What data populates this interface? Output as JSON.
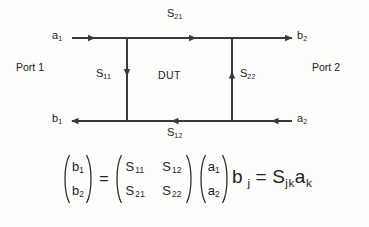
{
  "diagram": {
    "dut_label": "DUT",
    "ports": [
      {
        "name": "port-1",
        "label": "Port 1"
      },
      {
        "name": "port-2",
        "label": "Port 2"
      }
    ],
    "waves": {
      "a1": {
        "base": "a",
        "index": "1"
      },
      "b2": {
        "base": "b",
        "index": "2"
      },
      "b1": {
        "base": "b",
        "index": "1"
      },
      "a2": {
        "base": "a",
        "index": "2"
      }
    },
    "s_parameters": {
      "s21": {
        "base": "S",
        "index": "21",
        "position": "top",
        "direction": "left-to-right"
      },
      "s12": {
        "base": "S",
        "index": "12",
        "position": "bottom",
        "direction": "right-to-left"
      },
      "s11": {
        "base": "S",
        "index": "11",
        "position": "left-vertical",
        "direction": "down"
      },
      "s22": {
        "base": "S",
        "index": "22",
        "position": "right-vertical",
        "direction": "up"
      }
    },
    "line_color": "#3a3a3a"
  },
  "equations": {
    "matrix": {
      "lhs_vector": [
        {
          "base": "b",
          "index": "1"
        },
        {
          "base": "b",
          "index": "2"
        }
      ],
      "equals": "=",
      "matrix_rows": [
        [
          {
            "base": "S",
            "index": "11"
          },
          {
            "base": "S",
            "index": "12"
          }
        ],
        [
          {
            "base": "S",
            "index": "21"
          },
          {
            "base": "S",
            "index": "22"
          }
        ]
      ],
      "rhs_vector": [
        {
          "base": "a",
          "index": "1"
        },
        {
          "base": "a",
          "index": "2"
        }
      ]
    },
    "index_form": {
      "lhs_base": "b",
      "lhs_index": "j",
      "equals": "=",
      "s_base": "S",
      "s_index": "jk",
      "a_base": "a",
      "a_index": "k"
    }
  }
}
